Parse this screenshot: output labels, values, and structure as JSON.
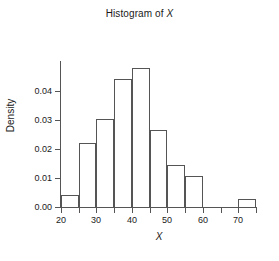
{
  "chart_data": {
    "type": "bar",
    "title": "Histogram of X",
    "title_prefix": "Histogram of ",
    "title_variable": "X",
    "xlabel": "X",
    "ylabel": "Density",
    "xlim": [
      20,
      75
    ],
    "ylim": [
      0.0,
      0.05
    ],
    "grid": false,
    "legend": null,
    "bin_width": 5,
    "bin_edges": [
      20,
      25,
      30,
      35,
      40,
      45,
      50,
      55,
      60,
      65,
      70,
      75
    ],
    "categories": [
      "20-25",
      "25-30",
      "30-35",
      "35-40",
      "40-45",
      "45-50",
      "50-55",
      "55-60",
      "60-65",
      "65-70",
      "70-75"
    ],
    "values": [
      0.0042,
      0.0222,
      0.0302,
      0.0442,
      0.0478,
      0.0265,
      0.0145,
      0.0106,
      0.0,
      0.0,
      0.0028
    ],
    "xticks": [
      20,
      30,
      40,
      50,
      60,
      70
    ],
    "xtick_labels": [
      "20",
      "30",
      "40",
      "50",
      "60",
      "70"
    ],
    "xminor_ticks": [
      25,
      35,
      45,
      55,
      65,
      75
    ],
    "yticks": [
      0.0,
      0.01,
      0.02,
      0.03,
      0.04
    ],
    "ytick_labels": [
      "0.00",
      "0.01",
      "0.02",
      "0.03",
      "0.04"
    ],
    "bar_edge_color": "#555555",
    "bar_fill_color": "#ffffff",
    "axis_color": "#555555",
    "background_color": "#ffffff"
  }
}
